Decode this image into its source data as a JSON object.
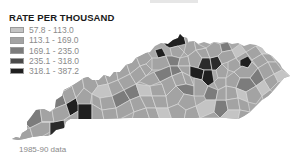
{
  "legend": {
    "title": "RATE PER THOUSAND",
    "items": [
      {
        "label": "57.8 - 113.0",
        "color": "#c4c4c4"
      },
      {
        "label": "113.1 - 169.0",
        "color": "#a3a3a3"
      },
      {
        "label": "169.1 - 235.0",
        "color": "#7c7c7c"
      },
      {
        "label": "235.1 - 318.0",
        "color": "#4a4a4a"
      },
      {
        "label": "318.1 - 387.2",
        "color": "#1f1f1f"
      }
    ]
  },
  "map": {
    "region": "Kentucky counties",
    "border_color": "#d8d8d8"
  },
  "footnote": "1985-90 data"
}
